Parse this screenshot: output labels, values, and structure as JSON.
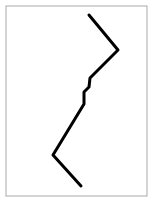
{
  "canvas": {
    "width": 154,
    "height": 203,
    "background_color": "#ffffff",
    "title": "Polyline Figure"
  },
  "frame": {
    "name": "image-border-frame",
    "x": 6,
    "y": 6,
    "width": 141,
    "height": 190,
    "stroke_color": "#a9a9a9",
    "stroke_width": 1,
    "fill_color": "#ffffff"
  },
  "chart_data": {
    "type": "line",
    "title": "",
    "subtitle": "",
    "xlabel": "",
    "ylabel": "",
    "grid": false,
    "legend": null,
    "axis_visible": false,
    "tick_labels_x": [],
    "tick_labels_y": [],
    "xlim": [
      0,
      154
    ],
    "ylim": [
      0,
      203
    ],
    "series": [
      {
        "name": "zigzag-polyline",
        "color": "#000000",
        "stroke_width": 3,
        "marker": "none",
        "points": [
          [
            89,
            15
          ],
          [
            118,
            50
          ],
          [
            90,
            78
          ],
          [
            89,
            87
          ],
          [
            84,
            92
          ],
          [
            84,
            104
          ],
          [
            53,
            155
          ],
          [
            81,
            186
          ]
        ],
        "x": [
          89,
          118,
          90,
          89,
          84,
          84,
          53,
          81
        ],
        "y": [
          15,
          50,
          78,
          87,
          92,
          104,
          155,
          186
        ]
      }
    ],
    "annotations": []
  },
  "path": {
    "d": "M 89 15 L 118 50 L 90 78 L 89 87 L 84 92 L 84 104 L 53 155 L 81 186",
    "stroke_color": "#000000",
    "stroke_width": 3,
    "name": "zigzag-polyline"
  }
}
